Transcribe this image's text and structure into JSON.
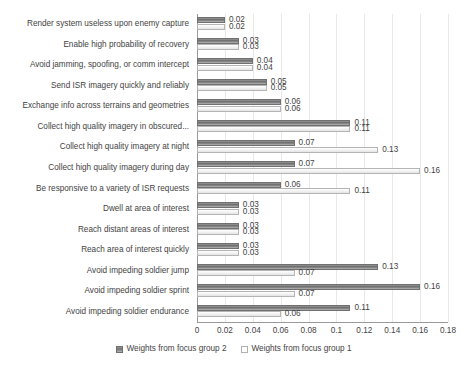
{
  "chart_data": {
    "type": "bar",
    "orientation": "horizontal",
    "title": "",
    "xlabel": "",
    "ylabel": "",
    "xlim": [
      0,
      0.18
    ],
    "xticks": [
      "0",
      "0.02",
      "0.04",
      "0.06",
      "0.08",
      "0.1",
      "0.12",
      "0.14",
      "0.16",
      "0.18"
    ],
    "xtick_values": [
      0,
      0.02,
      0.04,
      0.06,
      0.08,
      0.1,
      0.12,
      0.14,
      0.16,
      0.18
    ],
    "grid": true,
    "legend_position": "bottom-center",
    "categories": [
      "Render system useless upon enemy capture",
      "Enable high probability of recovery",
      "Avoid jamming, spoofing, or comm intercept",
      "Send ISR imagery quickly and reliably",
      "Exchange info across terrains and geometries",
      "Collect high quality imagery in obscured...",
      "Collect high quality imagery at night",
      "Collect high quality imagery during day",
      "Be responsive to a variety of ISR requests",
      "Dwell at area of interest",
      "Reach distant areas of interest",
      "Reach area of interest quickly",
      "Avoid impeding soldier jump",
      "Avoid impeding soldier sprint",
      "Avoid impeding soldier endurance"
    ],
    "series": [
      {
        "name": "Weights from focus group 2",
        "color": "#7a7a7a",
        "values": [
          0.02,
          0.03,
          0.04,
          0.05,
          0.06,
          0.11,
          0.07,
          0.07,
          0.06,
          0.03,
          0.03,
          0.03,
          0.13,
          0.16,
          0.11
        ],
        "labels": [
          "0.02",
          "0.03",
          "0.04",
          "0.05",
          "0.06",
          "0.11",
          "0.07",
          "0.07",
          "0.06",
          "0.03",
          "0.03",
          "0.03",
          "0.13",
          "0.16",
          "0.11"
        ]
      },
      {
        "name": "Weights from focus group 1",
        "color": "#f2f2f2",
        "values": [
          0.02,
          0.03,
          0.04,
          0.05,
          0.06,
          0.11,
          0.13,
          0.16,
          0.11,
          0.03,
          0.03,
          0.03,
          0.07,
          0.07,
          0.06
        ],
        "labels": [
          "0.02",
          "0.03",
          "0.04",
          "0.05",
          "0.06",
          "0.11",
          "0.13",
          "0.16",
          "0.11",
          "0.03",
          "0.03",
          "0.03",
          "0.07",
          "0.07",
          "0.06"
        ]
      }
    ]
  },
  "legend": {
    "items": [
      {
        "label": "Weights from focus group 2",
        "style": "dark"
      },
      {
        "label": "Weights from focus group 1",
        "style": "light"
      }
    ]
  }
}
